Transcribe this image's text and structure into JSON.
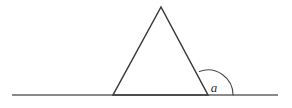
{
  "diagram": {
    "name": "exterior-angle-of-triangle",
    "background_color": "#ffffff",
    "canvas": {
      "width": 292,
      "height": 108
    },
    "labels": {
      "angle_a": "a"
    },
    "colors": {
      "triangle_stroke": "#3a3a3a",
      "baseline_stroke": "#8a8a8a",
      "arc_stroke": "#4a4a4a",
      "label_fill": "#2f2f2f"
    },
    "strokes": {
      "triangle_width": 1.5,
      "baseline_width": 1.8,
      "arc_width": 1.1
    },
    "baseline": {
      "name": "horizontal-baseline",
      "x1": 12,
      "y1": 95,
      "x2": 278,
      "y2": 95
    },
    "triangle": {
      "name": "triangle",
      "apex": {
        "x": 161,
        "y": 7
      },
      "left_vertex": {
        "x": 113,
        "y": 95
      },
      "right_vertex": {
        "x": 208,
        "y": 95
      },
      "points": "161,7 113,95 208,95"
    },
    "angle_arc": {
      "name": "exterior-angle-arc",
      "vertex": {
        "x": 208,
        "y": 95
      },
      "radius": 25,
      "start": {
        "x": 199.4,
        "y": 71.5
      },
      "end": {
        "x": 233,
        "y": 95
      },
      "path": "M 199.4 71.5 A 25 25 0 0 1 233 95"
    },
    "label_position": {
      "x": 214,
      "y": 92
    }
  }
}
